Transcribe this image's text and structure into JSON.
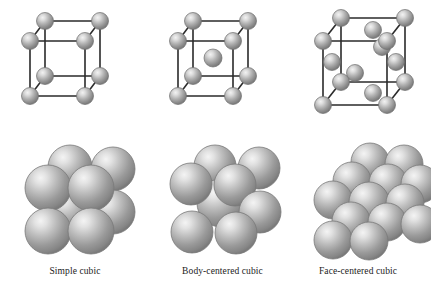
{
  "figure": {
    "background_color": "#ffffff",
    "atom_colors": {
      "highlight": "#ececec",
      "midtone": "#a9a9a9",
      "shadow": "#7d7d7d",
      "rim": "#6b6b6b",
      "edge_line": "#2b2b2b"
    }
  },
  "columns": [
    {
      "id": "simple-cubic",
      "caption": "Simple cubic",
      "wireframe": {
        "lattice_points": 8,
        "description": "eight corner atoms only",
        "corner_atoms": 8,
        "body_center_atoms": 0,
        "face_center_atoms": 0
      },
      "packing": {
        "visible_spheres": 7,
        "description": "space-filling model of simple cubic packing"
      }
    },
    {
      "id": "body-centered-cubic",
      "caption": "Body-centered cubic",
      "wireframe": {
        "lattice_points": 9,
        "description": "eight corner atoms plus one body-center atom",
        "corner_atoms": 8,
        "body_center_atoms": 1,
        "face_center_atoms": 0
      },
      "packing": {
        "visible_spheres": 8,
        "description": "space-filling model of body-centered cubic packing"
      }
    },
    {
      "id": "face-centered-cubic",
      "caption": "Face-centered cubic",
      "wireframe": {
        "lattice_points": 14,
        "description": "eight corner atoms plus six face-center atoms",
        "corner_atoms": 8,
        "body_center_atoms": 0,
        "face_center_atoms": 6
      },
      "packing": {
        "visible_spheres": 13,
        "description": "space-filling model of face-centered cubic packing"
      }
    }
  ]
}
